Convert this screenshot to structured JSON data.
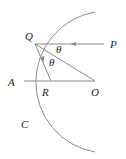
{
  "diagram": {
    "type": "geometry-reflection",
    "labels": {
      "Q": "Q",
      "P": "P",
      "A": "A",
      "R": "R",
      "O": "O",
      "C": "C",
      "theta_upper": "θ",
      "theta_lower": "θ"
    },
    "points": {
      "Q": [
        35,
        44
      ],
      "P": [
        104,
        44
      ],
      "A": [
        23,
        81
      ],
      "R": [
        51,
        81
      ],
      "O": [
        95,
        81
      ]
    },
    "arc": {
      "center": [
        95,
        82
      ],
      "radius": 71,
      "start": [
        95,
        12
      ],
      "end": [
        95,
        152
      ]
    },
    "colors": {
      "line": "#8a8a8a",
      "text": "#222222",
      "background": "#ffffff"
    }
  }
}
